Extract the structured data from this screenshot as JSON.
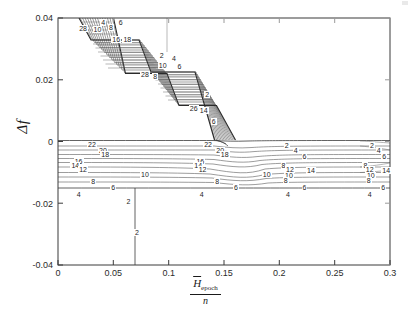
{
  "figure": {
    "background": "#ffffff",
    "frame_color": "#3a3a3a",
    "contour_color": "#555555"
  },
  "axes": {
    "x_label_numerator": "H",
    "x_label_numerator_sub": "epoch",
    "x_label_denominator": "n",
    "y_label": "Δf",
    "x_ticks": [
      "0",
      "0.05",
      "0.1",
      "0.15",
      "0.2",
      "0.25",
      "0.3"
    ],
    "y_ticks": [
      "0.04",
      "0.02",
      "0",
      "-0.02",
      "-0.04"
    ]
  },
  "chart_data": {
    "type": "line",
    "title": "",
    "xlabel": "H_epoch / n",
    "ylabel": "Δf",
    "xlim": [
      0,
      0.3
    ],
    "ylim": [
      -0.04,
      0.04
    ],
    "grid": false,
    "legend": "none",
    "plot_kind": "contour",
    "contour_levels": [
      2,
      4,
      6,
      8,
      10,
      12,
      14,
      16,
      18,
      20,
      22,
      24,
      26,
      28
    ],
    "inline_labels": [
      {
        "text": "4",
        "x": 0.04,
        "y": 0.0385
      },
      {
        "text": "8",
        "x": 0.047,
        "y": 0.0368
      },
      {
        "text": "6",
        "x": 0.056,
        "y": 0.0383
      },
      {
        "text": "10",
        "x": 0.035,
        "y": 0.036
      },
      {
        "text": "28",
        "x": 0.022,
        "y": 0.0365
      },
      {
        "text": "16",
        "x": 0.052,
        "y": 0.033
      },
      {
        "text": "18",
        "x": 0.062,
        "y": 0.033
      },
      {
        "text": "2",
        "x": 0.093,
        "y": 0.0277
      },
      {
        "text": "4",
        "x": 0.104,
        "y": 0.0268
      },
      {
        "text": "10",
        "x": 0.094,
        "y": 0.0243
      },
      {
        "text": "6",
        "x": 0.109,
        "y": 0.024
      },
      {
        "text": "28",
        "x": 0.078,
        "y": 0.0215
      },
      {
        "text": "8",
        "x": 0.087,
        "y": 0.0208
      },
      {
        "text": "2",
        "x": 0.134,
        "y": 0.015
      },
      {
        "text": "26",
        "x": 0.122,
        "y": 0.0105
      },
      {
        "text": "14",
        "x": 0.131,
        "y": 0.0098
      },
      {
        "text": "6",
        "x": 0.14,
        "y": 0.0062
      },
      {
        "text": "22",
        "x": 0.03,
        "y": -0.0012
      },
      {
        "text": "22",
        "x": 0.135,
        "y": -0.0012
      },
      {
        "text": "20",
        "x": 0.04,
        "y": -0.003
      },
      {
        "text": "20",
        "x": 0.146,
        "y": -0.003
      },
      {
        "text": "18",
        "x": 0.042,
        "y": -0.0043
      },
      {
        "text": "18",
        "x": 0.15,
        "y": -0.0043
      },
      {
        "text": "16",
        "x": 0.018,
        "y": -0.0065
      },
      {
        "text": "16",
        "x": 0.128,
        "y": -0.0065
      },
      {
        "text": "14",
        "x": 0.015,
        "y": -0.0078
      },
      {
        "text": "14",
        "x": 0.126,
        "y": -0.0078
      },
      {
        "text": "12",
        "x": 0.022,
        "y": -0.0092
      },
      {
        "text": "12",
        "x": 0.13,
        "y": -0.0092
      },
      {
        "text": "10",
        "x": 0.078,
        "y": -0.0108
      },
      {
        "text": "10",
        "x": 0.188,
        "y": -0.0108
      },
      {
        "text": "8",
        "x": 0.031,
        "y": -0.0132
      },
      {
        "text": "8",
        "x": 0.143,
        "y": -0.0132
      },
      {
        "text": "6",
        "x": 0.049,
        "y": -0.015
      },
      {
        "text": "6",
        "x": 0.16,
        "y": -0.015
      },
      {
        "text": "4",
        "x": 0.018,
        "y": -0.0172
      },
      {
        "text": "4",
        "x": 0.129,
        "y": -0.0172
      },
      {
        "text": "2",
        "x": 0.063,
        "y": -0.0196
      },
      {
        "text": "2",
        "x": 0.206,
        "y": -0.0015
      },
      {
        "text": "4",
        "x": 0.214,
        "y": -0.0032
      },
      {
        "text": "6",
        "x": 0.222,
        "y": -0.005
      },
      {
        "text": "8",
        "x": 0.203,
        "y": -0.008
      },
      {
        "text": "12",
        "x": 0.209,
        "y": -0.0093
      },
      {
        "text": "14",
        "x": 0.228,
        "y": -0.0095
      },
      {
        "text": "10",
        "x": 0.208,
        "y": -0.0112
      },
      {
        "text": "8",
        "x": 0.205,
        "y": -0.0128
      },
      {
        "text": "6",
        "x": 0.222,
        "y": -0.015
      },
      {
        "text": "4",
        "x": 0.207,
        "y": -0.0172
      },
      {
        "text": "2",
        "x": 0.283,
        "y": -0.0015
      },
      {
        "text": "4",
        "x": 0.289,
        "y": -0.0032
      },
      {
        "text": "6",
        "x": 0.294,
        "y": -0.005
      },
      {
        "text": "8",
        "x": 0.277,
        "y": -0.0078
      },
      {
        "text": "12",
        "x": 0.281,
        "y": -0.0092
      },
      {
        "text": "14",
        "x": 0.296,
        "y": -0.0095
      },
      {
        "text": "10",
        "x": 0.282,
        "y": -0.0112
      },
      {
        "text": "8",
        "x": 0.28,
        "y": -0.0128
      },
      {
        "text": "6",
        "x": 0.293,
        "y": -0.015
      },
      {
        "text": "4",
        "x": 0.281,
        "y": -0.0172
      },
      {
        "text": "2",
        "x": 0.0705,
        "y": -0.0295
      }
    ]
  }
}
